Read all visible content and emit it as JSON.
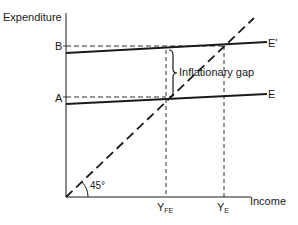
{
  "diagram": {
    "title": "Inflationary gap",
    "y_axis_label": "Expenditure",
    "x_axis_label": "Income",
    "y_ticks": [
      {
        "label": "B"
      },
      {
        "label": "A"
      }
    ],
    "x_ticks": [
      {
        "main": "Y",
        "sub": "FE"
      },
      {
        "main": "Y",
        "sub": "E"
      }
    ],
    "lines": [
      {
        "name": "E'",
        "label": "E'",
        "style": "solid"
      },
      {
        "name": "E",
        "label": "E",
        "style": "solid"
      },
      {
        "name": "45-degree line",
        "style": "dashed"
      }
    ],
    "angle_label": "45°",
    "gap_label": "Inflationary gap",
    "colors": {
      "ink": "#1a1a1a",
      "background": "#ffffff"
    }
  }
}
